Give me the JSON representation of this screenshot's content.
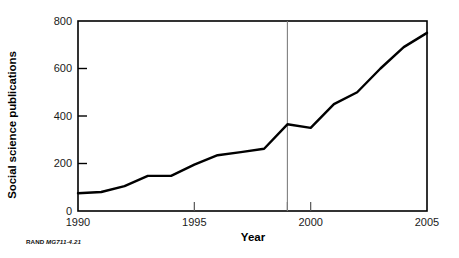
{
  "figure": {
    "credit_rand": "RAND",
    "credit_code": "MG711-4.21"
  },
  "chart_data": {
    "type": "line",
    "title": "",
    "xlabel": "Year",
    "ylabel": "Social science publications",
    "x": [
      1990,
      1991,
      1992,
      1993,
      1994,
      1995,
      1996,
      1997,
      1998,
      1999,
      2000,
      2001,
      2002,
      2003,
      2004,
      2005
    ],
    "values": [
      75,
      80,
      105,
      148,
      148,
      195,
      235,
      248,
      262,
      365,
      350,
      450,
      500,
      600,
      690,
      750
    ],
    "series": [
      {
        "name": "Social science publications",
        "values": [
          75,
          80,
          105,
          148,
          148,
          195,
          235,
          248,
          262,
          365,
          350,
          450,
          500,
          600,
          690,
          750
        ]
      }
    ],
    "xlim": [
      1990,
      2005
    ],
    "ylim": [
      0,
      800
    ],
    "yticks": [
      0,
      200,
      400,
      600,
      800
    ],
    "ytick_labels": [
      "0",
      "200",
      "400",
      "600",
      "800"
    ],
    "xticks": [
      1990,
      1995,
      2000,
      2005
    ],
    "xtick_labels": [
      "1990",
      "1995",
      "2000",
      "2005"
    ],
    "minor_xticks": [
      1999
    ],
    "grid": false,
    "legend": "none",
    "line_color": "#000000",
    "axis_color": "#000000",
    "reference_line": {
      "x": 1999,
      "color": "#7f7f7f",
      "orientation": "vertical"
    }
  }
}
